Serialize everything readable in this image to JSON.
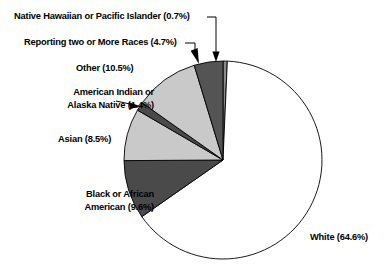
{
  "chart_data": {
    "type": "pie",
    "title": "",
    "subtitle": "",
    "xlabel": "",
    "ylabel": "",
    "legend_position": "none",
    "grid": false,
    "units": "percent",
    "start_angle_deg": 0,
    "direction": "clockwise",
    "categories": [
      "Native Hawaiian or Pacific Islander",
      "White",
      "Black or African American",
      "Asian",
      "American Indian or Alaska Native",
      "Other",
      "Reporting two or More Races"
    ],
    "values": [
      0.7,
      64.6,
      9.6,
      8.5,
      1.4,
      10.5,
      4.7
    ],
    "slices": [
      {
        "name": "Native Hawaiian or Pacific Islander",
        "value": 0.7,
        "label": "Native Hawaiian or Pacific Islander (0.7%)",
        "label_lines": [
          "Native Hawaiian or Pacific Islander (0.7%)"
        ],
        "color": "#8a8a8a",
        "leader": "elbow"
      },
      {
        "name": "White",
        "value": 64.6,
        "label": "White (64.6%)",
        "label_lines": [
          "White (64.6%)"
        ],
        "color": "#ffffff",
        "leader": "none"
      },
      {
        "name": "Black or African American",
        "value": 9.6,
        "label": "Black or African American (9.6%)",
        "label_lines": [
          "Black or African",
          "American (9.6%)"
        ],
        "color": "#4a4a4a",
        "leader": "none"
      },
      {
        "name": "Asian",
        "value": 8.5,
        "label": "Asian (8.5%)",
        "label_lines": [
          "Asian (8.5%)"
        ],
        "color": "#c9c9c9",
        "leader": "none"
      },
      {
        "name": "American Indian or Alaska Native",
        "value": 1.4,
        "label": "American Indian or Alaska Native (1.4%)",
        "label_lines": [
          "American Indian or",
          "Alaska Native (1.4%)"
        ],
        "color": "#4a4a4a",
        "leader": "arrow"
      },
      {
        "name": "Other",
        "value": 10.5,
        "label": "Other (10.5%)",
        "label_lines": [
          "Other (10.5%)"
        ],
        "color": "#c9c9c9",
        "leader": "none"
      },
      {
        "name": "Reporting two or More Races",
        "value": 4.7,
        "label": "Reporting two or More Races (4.7%)",
        "label_lines": [
          "Reporting two or More Races (4.7%)"
        ],
        "color": "#545454",
        "leader": "arrow"
      }
    ],
    "geometry": {
      "center_x": 223,
      "center_y": 160,
      "radius": 99
    },
    "colors": {
      "outline": "#000000",
      "background": "#ffffff",
      "text": "#000000"
    }
  },
  "labels": {
    "native_hawaiian": "Native Hawaiian or Pacific Islander (0.7%)",
    "two_or_more": "Reporting two or More Races (4.7%)",
    "other": "Other (10.5%)",
    "american_indian_l1": "American Indian or",
    "american_indian_l2": "Alaska Native (1.4%)",
    "asian": "Asian (8.5%)",
    "black_l1": "Black or African",
    "black_l2": "American (9.6%)",
    "white": "White (64.6%)"
  }
}
